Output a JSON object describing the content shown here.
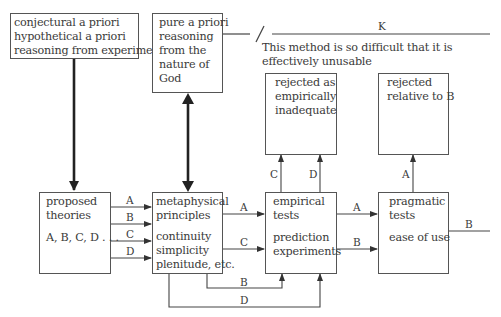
{
  "diagram": {
    "boxes": {
      "conjectural": {
        "lines": [
          "conjectural a priori",
          "hypothetical a priori",
          "reasoning from experiment"
        ]
      },
      "pure_a_priori": {
        "lines": [
          "pure a priori",
          "reasoning",
          "from the",
          "nature of",
          "God"
        ]
      },
      "rejected_empirical": {
        "lines": [
          "rejected as",
          "empirically",
          "inadequate"
        ]
      },
      "rejected_relative": {
        "lines": [
          "rejected",
          "relative to B"
        ]
      },
      "proposed_theories": {
        "lines": [
          "proposed",
          "theories"
        ],
        "list": "A, B, C, D . . ."
      },
      "metaphysical": {
        "lines": [
          "metaphysical",
          "principles"
        ],
        "sub": [
          "continuity",
          "simplicity",
          "plenitude, etc."
        ]
      },
      "empirical_tests": {
        "lines": [
          "empirical",
          "tests"
        ],
        "sub": [
          "prediction",
          "experiments"
        ]
      },
      "pragmatic_tests": {
        "lines": [
          "pragmatic",
          "tests"
        ],
        "sub": [
          "ease of use"
        ]
      }
    },
    "k_label": "K",
    "note": [
      "This method is so difficult that it is",
      "effectively unusable"
    ],
    "edge_labels": {
      "pt_to_mp": [
        "A",
        "B",
        "C",
        "D"
      ],
      "mp_to_et": [
        "A",
        "C"
      ],
      "mp_bottom": [
        "B",
        "D"
      ],
      "et_up": [
        "C",
        "D"
      ],
      "et_to_pr": [
        "A",
        "B"
      ],
      "pr_up": "A",
      "pr_out": "B"
    },
    "colors": {
      "line": "#333333",
      "box_border": "#555555",
      "text": "#3a3a3a"
    }
  }
}
